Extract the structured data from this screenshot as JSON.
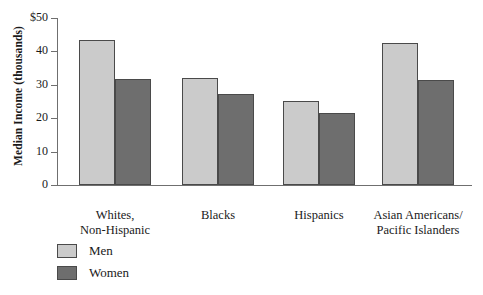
{
  "chart_data": {
    "type": "bar",
    "title": "",
    "xlabel": "",
    "ylabel": "Median Income (thousands)",
    "ylim": [
      0,
      50
    ],
    "yticks": [
      0,
      10,
      20,
      30,
      40,
      50
    ],
    "ytick_labels": [
      "0",
      "10",
      "20",
      "30",
      "40",
      "$50"
    ],
    "grid": false,
    "legend_position": "bottom-left",
    "categories": [
      "Whites,\nNon-Hispanic",
      "Blacks",
      "Hispanics",
      "Asian Americans/\nPacific Islanders"
    ],
    "series": [
      {
        "name": "Men",
        "color": "#cbcbcb",
        "values": [
          43.4,
          32.0,
          25.2,
          42.4
        ]
      },
      {
        "name": "Women",
        "color": "#6e6e6e",
        "values": [
          31.7,
          27.2,
          21.7,
          31.4
        ]
      }
    ]
  },
  "axis": {
    "y_title": "Median Income (thousands)",
    "ticks": [
      {
        "value": 50,
        "label": "$50"
      },
      {
        "value": 40,
        "label": "40"
      },
      {
        "value": 30,
        "label": "30"
      },
      {
        "value": 20,
        "label": "20"
      },
      {
        "value": 10,
        "label": "10"
      },
      {
        "value": 0,
        "label": "0"
      }
    ]
  },
  "categories": [
    {
      "line1": "Whites,",
      "line2": "Non-Hispanic"
    },
    {
      "line1": "Blacks",
      "line2": ""
    },
    {
      "line1": "Hispanics",
      "line2": ""
    },
    {
      "line1": "Asian Americans/",
      "line2": "Pacific Islanders"
    }
  ],
  "legend": {
    "items": [
      {
        "label": "Men",
        "color": "#cbcbcb"
      },
      {
        "label": "Women",
        "color": "#6e6e6e"
      }
    ]
  },
  "colors": {
    "men": "#cbcbcb",
    "women": "#6e6e6e",
    "bar_border": "#4a4a4a",
    "axis": "#6f6f6f",
    "text": "#1a1a1a",
    "background": "#ffffff"
  }
}
